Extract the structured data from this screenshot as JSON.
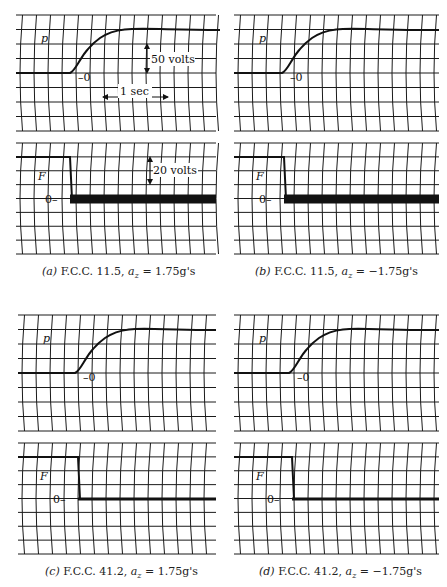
{
  "figure": {
    "panels": [
      {
        "id": "a",
        "caption": {
          "label": "(a)",
          "text": "F.C.C. 11.5,",
          "var": "a",
          "sub": "z",
          "eq": "= 1.75g's"
        },
        "top_trace": {
          "name": "p",
          "zero_label": "0"
        },
        "bottom_trace": {
          "name": "F",
          "zero_label": "0"
        },
        "annotations": {
          "voltage_top": "50 volts",
          "time_scale": "1 sec",
          "voltage_bottom": "20 volts"
        }
      },
      {
        "id": "b",
        "caption": {
          "label": "(b)",
          "text": "F.C.C. 11.5,",
          "var": "a",
          "sub": "z",
          "eq": "= −1.75g's"
        },
        "top_trace": {
          "name": "p",
          "zero_label": "0"
        },
        "bottom_trace": {
          "name": "F",
          "zero_label": "0"
        }
      },
      {
        "id": "c",
        "caption": {
          "label": "(c)",
          "text": "F.C.C. 41.2,",
          "var": "a",
          "sub": "z",
          "eq": "= 1.75g's"
        },
        "top_trace": {
          "name": "p",
          "zero_label": "0"
        },
        "bottom_trace": {
          "name": "F",
          "zero_label": "0"
        }
      },
      {
        "id": "d",
        "caption": {
          "label": "(d)",
          "text": "F.C.C. 41.2,",
          "var": "a",
          "sub": "z",
          "eq": "= −1.75g's"
        },
        "top_trace": {
          "name": "p",
          "zero_label": "0"
        },
        "bottom_trace": {
          "name": "F",
          "zero_label": "0"
        }
      }
    ]
  },
  "colors": {
    "grid": "#1a1a1a",
    "trace": "#111111",
    "background": "#ffffff"
  }
}
